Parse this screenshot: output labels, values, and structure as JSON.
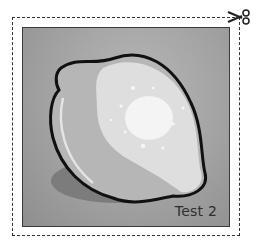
{
  "card": {
    "label": "Test 2",
    "subject": "lemon",
    "icons": [
      "scissors-icon"
    ]
  },
  "colors": {
    "background": "#ffffff",
    "card_bg": "#a2a2a2",
    "outline": "#111111",
    "lemon_shade": "#b4b4b4",
    "lemon_light": "#dcdcdc",
    "lemon_highlight": "#f2f2f2",
    "shadow": "#7a7a7a"
  }
}
